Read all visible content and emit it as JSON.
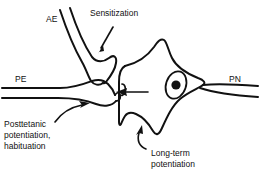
{
  "figure": {
    "background_color": "#ffffff",
    "stroke_color": "#111111",
    "width": 260,
    "height": 178
  },
  "abbreviations": [
    {
      "id": "ae",
      "label": "AE",
      "meaning": "axon ending",
      "x": 46,
      "y": 22
    },
    {
      "id": "pe",
      "label": "PE",
      "meaning": "presynaptic element",
      "x": 15,
      "y": 82
    },
    {
      "id": "pn",
      "label": "PN",
      "meaning": "postsynaptic neuron",
      "x": 229,
      "y": 82
    }
  ],
  "annotations": [
    {
      "id": "sensitization",
      "lines": [
        "Sensitization"
      ],
      "x": 90,
      "y": 16
    },
    {
      "id": "posttetanic",
      "lines": [
        "Posttetanic",
        "potentiation,",
        "habituation"
      ],
      "x": 4,
      "y": 127
    },
    {
      "id": "long-term-potentiation",
      "lines": [
        "Long-term",
        "potentiation"
      ],
      "x": 151,
      "y": 156
    }
  ],
  "structures": {
    "axon_ending_name": "axon-ending-terminal",
    "presynaptic_element_name": "presynaptic-axon",
    "postsynaptic_neuron_name": "postsynaptic-cell-body",
    "nucleus_name": "cell-nucleus",
    "nucleolus_name": "nucleolus",
    "postsynaptic_axon_name": "postsynaptic-axon"
  }
}
